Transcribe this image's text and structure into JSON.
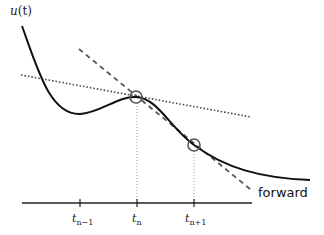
{
  "diagram": {
    "type": "numerical-scheme-illustration",
    "y_axis_label": {
      "base": "u",
      "arg": "(t)"
    },
    "annotation": "forward",
    "time_axis": {
      "ticks": [
        {
          "base": "t",
          "sub": "n−1",
          "x": 80
        },
        {
          "base": "t",
          "sub": "n",
          "x": 137
        },
        {
          "base": "t",
          "sub": "n+1",
          "x": 194
        }
      ]
    },
    "points": [
      {
        "name": "u(t_n)",
        "x": 136,
        "y": 97
      },
      {
        "name": "u(t_n+1)",
        "x": 194,
        "y": 145
      }
    ],
    "lines": {
      "solution_curve": "solid",
      "tangent_at_tn": "dotted",
      "forward_step": "dashed"
    },
    "colors": {
      "curve": "#111111",
      "dashed": "#555555",
      "dotted": "#444444",
      "circle": "#555555",
      "guide": "#999999"
    }
  }
}
